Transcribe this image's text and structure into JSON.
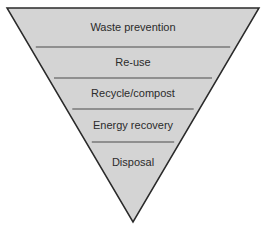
{
  "diagram": {
    "type": "inverted-pyramid",
    "fill_color": "#d4d4d4",
    "stroke_color": "#2a2a2a",
    "divider_color": "#4a4a4a",
    "text_color": "#2b2b2b",
    "levels": [
      {
        "label": "Waste prevention"
      },
      {
        "label": "Re-use"
      },
      {
        "label": "Recycle/compost"
      },
      {
        "label": "Energy recovery"
      },
      {
        "label": "Disposal"
      }
    ]
  }
}
